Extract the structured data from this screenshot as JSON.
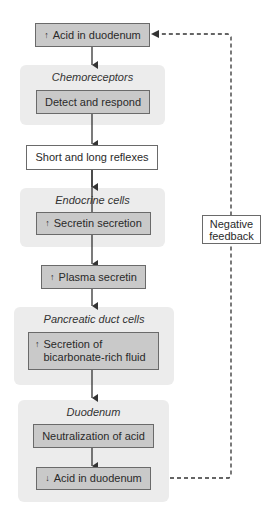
{
  "diagram": {
    "nodes": [
      {
        "id": "acid_up",
        "symbol": "↑",
        "label": "Acid in duodenum"
      },
      {
        "id": "chemo_panel",
        "label": "Chemoreceptors"
      },
      {
        "id": "detect",
        "label": "Detect and respond"
      },
      {
        "id": "reflexes",
        "label": "Short and long reflexes"
      },
      {
        "id": "endocrine_panel",
        "label": "Endocrine cells"
      },
      {
        "id": "secretin_secretion",
        "symbol": "↑",
        "label": "Secretin secretion"
      },
      {
        "id": "plasma_secretin",
        "symbol": "↑",
        "label": "Plasma secretin"
      },
      {
        "id": "pancreatic_panel",
        "label": "Pancreatic duct cells"
      },
      {
        "id": "bicarb",
        "symbol": "↑",
        "label_line1": "Secretion of",
        "label_line2": "bicarbonate-rich fluid"
      },
      {
        "id": "duodenum_panel",
        "label": "Duodenum"
      },
      {
        "id": "neutralization",
        "label": "Neutralization of acid"
      },
      {
        "id": "acid_down",
        "symbol": "↓",
        "label": "Acid in duodenum"
      }
    ],
    "feedback": {
      "label_line1": "Negative",
      "label_line2": "feedback",
      "style": "dashed"
    },
    "edges": [
      [
        "acid_up",
        "detect"
      ],
      [
        "detect",
        "reflexes"
      ],
      [
        "reflexes",
        "secretin_secretion"
      ],
      [
        "secretin_secretion",
        "plasma_secretin"
      ],
      [
        "plasma_secretin",
        "bicarb"
      ],
      [
        "bicarb",
        "neutralization"
      ],
      [
        "neutralization",
        "acid_down"
      ],
      [
        "acid_down",
        "acid_up",
        "negative feedback (dashed)"
      ]
    ],
    "colors": {
      "panel_fill": "#ececec",
      "box_fill": "#c9c9c9",
      "box_border": "#6a6a6a",
      "line": "#333333"
    }
  }
}
